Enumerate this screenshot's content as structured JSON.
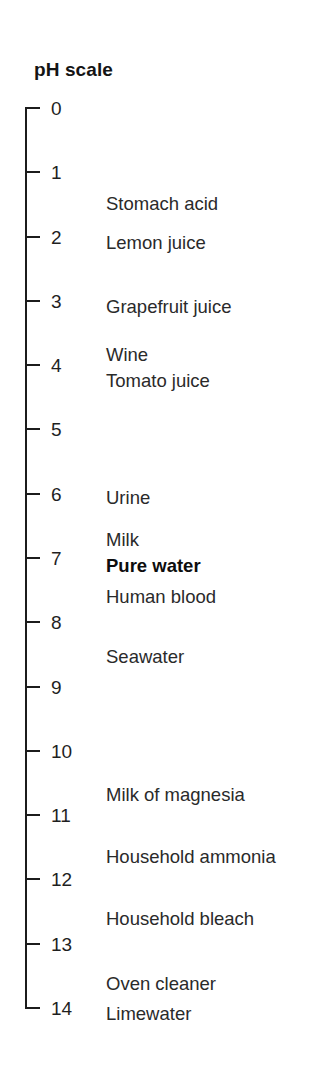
{
  "title": "pH scale",
  "axis": {
    "min": 0,
    "max": 14,
    "ticks": [
      {
        "value": 0,
        "label": "0"
      },
      {
        "value": 1,
        "label": "1"
      },
      {
        "value": 2,
        "label": "2"
      },
      {
        "value": 3,
        "label": "3"
      },
      {
        "value": 4,
        "label": "4"
      },
      {
        "value": 5,
        "label": "5"
      },
      {
        "value": 6,
        "label": "6"
      },
      {
        "value": 7,
        "label": "7"
      },
      {
        "value": 8,
        "label": "8"
      },
      {
        "value": 9,
        "label": "9"
      },
      {
        "value": 10,
        "label": "10"
      },
      {
        "value": 11,
        "label": "11"
      },
      {
        "value": 12,
        "label": "12"
      },
      {
        "value": 13,
        "label": "13"
      },
      {
        "value": 14,
        "label": "14"
      }
    ]
  },
  "substances": [
    {
      "label": "Stomach acid",
      "ph": 1.5,
      "bold": false
    },
    {
      "label": "Lemon juice",
      "ph": 2.1,
      "bold": false
    },
    {
      "label": "Grapefruit juice",
      "ph": 3.1,
      "bold": false
    },
    {
      "label": "Wine",
      "ph": 3.85,
      "bold": false
    },
    {
      "label": "Tomato juice",
      "ph": 4.24,
      "bold": false
    },
    {
      "label": "Urine",
      "ph": 6.06,
      "bold": false
    },
    {
      "label": "Milk",
      "ph": 6.72,
      "bold": false
    },
    {
      "label": "Pure water",
      "ph": 7.12,
      "bold": true
    },
    {
      "label": "Human blood",
      "ph": 7.6,
      "bold": false
    },
    {
      "label": "Seawater",
      "ph": 8.54,
      "bold": false
    },
    {
      "label": "Milk of magnesia",
      "ph": 10.68,
      "bold": false
    },
    {
      "label": "Household ammonia",
      "ph": 11.65,
      "bold": false
    },
    {
      "label": "Household bleach",
      "ph": 12.62,
      "bold": false
    },
    {
      "label": "Oven cleaner",
      "ph": 13.63,
      "bold": false
    },
    {
      "label": "Limewater",
      "ph": 14.1,
      "bold": false
    }
  ],
  "geometry": {
    "axis_top_px": 108,
    "axis_bottom_px": 1008,
    "unit_px": 64.2857
  },
  "colors": {
    "axis": "#1c1c1c",
    "text": "#2a2a2a",
    "title": "#141414",
    "background": "#ffffff"
  }
}
